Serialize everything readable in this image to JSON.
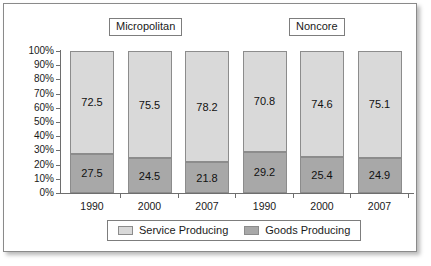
{
  "chart_data": {
    "type": "bar",
    "subtype": "stacked-100-percent",
    "title": "",
    "xlabel": "",
    "ylabel": "",
    "categories": [
      "1990",
      "2000",
      "2007",
      "1990",
      "2000",
      "2007"
    ],
    "groups": [
      {
        "label": "Micropolitan",
        "categories": [
          "1990",
          "2000",
          "2007"
        ]
      },
      {
        "label": "Noncore",
        "categories": [
          "1990",
          "2000",
          "2007"
        ]
      }
    ],
    "series": [
      {
        "name": "Service Producing",
        "color": "#d9d9d9",
        "values": [
          72.5,
          75.5,
          78.2,
          70.8,
          74.6,
          75.1
        ]
      },
      {
        "name": "Goods Producing",
        "color": "#a8a8a8",
        "values": [
          27.5,
          24.5,
          21.8,
          29.2,
          25.4,
          24.9
        ]
      }
    ],
    "ylim": [
      0,
      100
    ],
    "ytick_labels": [
      "100%",
      "90%",
      "80%",
      "70%",
      "60%",
      "50%",
      "40%",
      "30%",
      "20%",
      "10%",
      "0%"
    ],
    "ytick_values": [
      100,
      90,
      80,
      70,
      60,
      50,
      40,
      30,
      20,
      10,
      0
    ],
    "grid": false,
    "legend_position": "bottom",
    "legend": [
      "Service Producing",
      "Goods Producing"
    ]
  },
  "labels": {
    "group_micropolitan": "Micropolitan",
    "group_noncore": "Noncore"
  },
  "legend": {
    "items": [
      {
        "label": "Service Producing",
        "color": "#d9d9d9"
      },
      {
        "label": "Goods Producing",
        "color": "#a8a8a8"
      }
    ]
  },
  "colors": {
    "service": "#d9d9d9",
    "goods": "#a8a8a8",
    "axis": "#6e6e6e",
    "border": "#8a8a8a",
    "text": "#1a1a1a"
  }
}
